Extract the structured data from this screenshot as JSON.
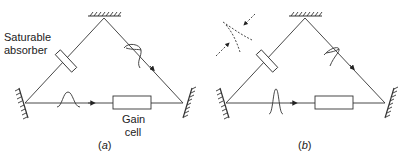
{
  "figure": {
    "panels": [
      {
        "id": "a",
        "caption_prefix": "(",
        "caption_letter": "a",
        "caption_suffix": ")",
        "labels": {
          "absorber_line1": "Saturable",
          "absorber_line2": "absorber",
          "gain_line1": "Gain",
          "gain_line2": "cell"
        },
        "pulse": "broad"
      },
      {
        "id": "b",
        "caption_prefix": "(",
        "caption_letter": "b",
        "caption_suffix": ")",
        "pulse": "narrow",
        "extra": "dashed-beam-focus-icon"
      }
    ],
    "colors": {
      "line": "#333333",
      "background": "#ffffff"
    }
  }
}
